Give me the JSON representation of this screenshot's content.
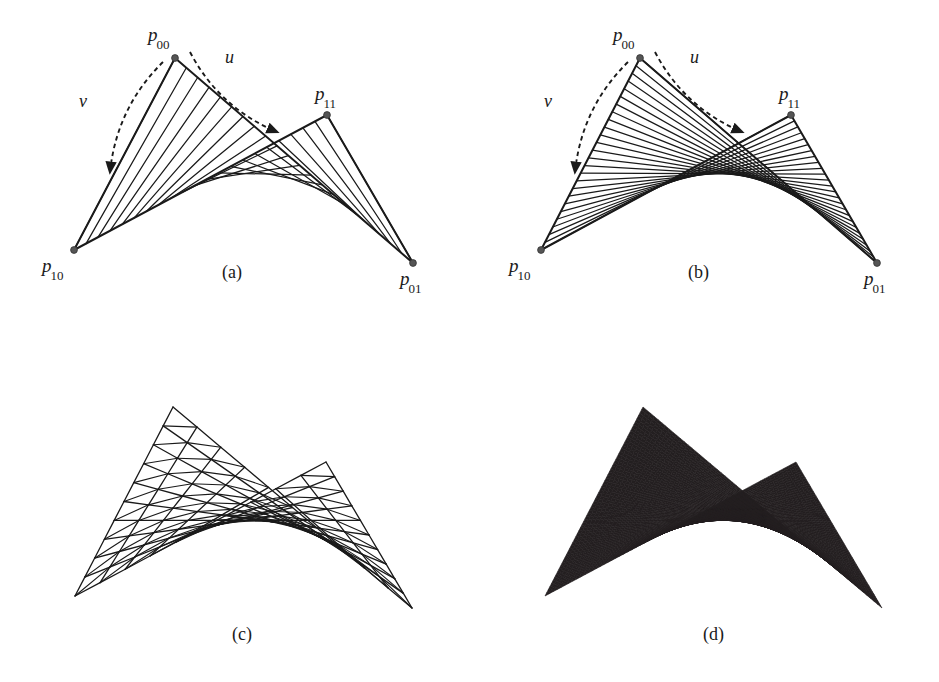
{
  "figure": {
    "background_color": "#ffffff",
    "ink_color": "#1a1a1a",
    "fill_color": "#231f20",
    "width": 939,
    "height": 682
  },
  "panels": [
    {
      "id": "a",
      "caption": "(a)",
      "caption_pos": {
        "x": 222,
        "y": 262
      },
      "render_mode": "u-rulings",
      "ruling_count": 21,
      "corners": {
        "p00": {
          "x": 175,
          "y": 58
        },
        "p10": {
          "x": 74,
          "y": 250
        },
        "p11": {
          "x": 327,
          "y": 115
        },
        "p01": {
          "x": 413,
          "y": 263
        }
      },
      "corner_labels": [
        {
          "name": "p00",
          "base": "p",
          "sub": "00",
          "x": 148,
          "y": 24
        },
        {
          "name": "p10",
          "base": "p",
          "sub": "10",
          "x": 42,
          "y": 255
        },
        {
          "name": "p11",
          "base": "p",
          "sub": "11",
          "x": 315,
          "y": 83
        },
        {
          "name": "p01",
          "base": "p",
          "sub": "01",
          "x": 400,
          "y": 268
        }
      ],
      "param_arrows": [
        {
          "name": "u",
          "label": "u",
          "label_x": 225,
          "label_y": 47,
          "from": {
            "x": 190,
            "y": 52
          },
          "to": {
            "x": 277,
            "y": 132
          }
        },
        {
          "name": "v",
          "label": "v",
          "label_x": 79,
          "label_y": 91,
          "from": {
            "x": 163,
            "y": 62
          },
          "to": {
            "x": 110,
            "y": 172
          }
        }
      ]
    },
    {
      "id": "b",
      "caption": "(b)",
      "caption_pos": {
        "x": 688,
        "y": 262
      },
      "render_mode": "v-rulings",
      "ruling_count": 25,
      "corners": {
        "p00": {
          "x": 640,
          "y": 58
        },
        "p10": {
          "x": 541,
          "y": 250
        },
        "p11": {
          "x": 791,
          "y": 115
        },
        "p01": {
          "x": 877,
          "y": 263
        }
      },
      "corner_labels": [
        {
          "name": "p00",
          "base": "p",
          "sub": "00",
          "x": 613,
          "y": 24
        },
        {
          "name": "p10",
          "base": "p",
          "sub": "10",
          "x": 509,
          "y": 255
        },
        {
          "name": "p11",
          "base": "p",
          "sub": "11",
          "x": 779,
          "y": 83
        },
        {
          "name": "p01",
          "base": "p",
          "sub": "01",
          "x": 864,
          "y": 268
        }
      ],
      "param_arrows": [
        {
          "name": "u",
          "label": "u",
          "label_x": 690,
          "label_y": 47,
          "from": {
            "x": 655,
            "y": 52
          },
          "to": {
            "x": 742,
            "y": 132
          }
        },
        {
          "name": "v",
          "label": "v",
          "label_x": 544,
          "label_y": 91,
          "from": {
            "x": 628,
            "y": 62
          },
          "to": {
            "x": 575,
            "y": 172
          }
        }
      ]
    },
    {
      "id": "c",
      "caption": "(c)",
      "caption_pos": {
        "x": 232,
        "y": 624
      },
      "render_mode": "triangulated-wireframe",
      "mesh_divisions": 10,
      "corners": {
        "p00": {
          "x": 173,
          "y": 407
        },
        "p10": {
          "x": 75,
          "y": 596
        },
        "p11": {
          "x": 326,
          "y": 462
        },
        "p01": {
          "x": 412,
          "y": 608
        }
      },
      "corner_labels": [],
      "param_arrows": []
    },
    {
      "id": "d",
      "caption": "(d)",
      "caption_pos": {
        "x": 703,
        "y": 624
      },
      "render_mode": "solid-fill",
      "corners": {
        "p00": {
          "x": 643,
          "y": 407
        },
        "p10": {
          "x": 545,
          "y": 596
        },
        "p11": {
          "x": 796,
          "y": 462
        },
        "p01": {
          "x": 882,
          "y": 608
        }
      },
      "corner_labels": [],
      "param_arrows": []
    }
  ]
}
